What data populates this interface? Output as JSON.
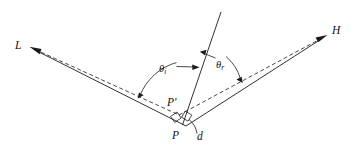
{
  "figure": {
    "background_color": "#ffffff",
    "line_color": "#1a1a1a",
    "labels": {
      "light_vector": "L",
      "halfway_vector": "H",
      "point": "P",
      "point_prime": "P'",
      "distance": "d",
      "theta_incident_base": "θ",
      "theta_incident_sub": "i",
      "theta_reflected_base": "θ",
      "theta_reflected_sub": "r"
    },
    "elements": [
      {
        "name": "L-vector-arrow",
        "kind": "arrow",
        "from": [
          186,
          126
        ],
        "to": [
          30,
          47
        ]
      },
      {
        "name": "H-vector-arrow",
        "kind": "arrow",
        "from": [
          186,
          126
        ],
        "to": [
          327,
          35
        ]
      },
      {
        "name": "normal-ray",
        "kind": "line",
        "from": [
          183,
          124
        ],
        "to": [
          221,
          12
        ]
      },
      {
        "name": "L-dashed-parallel",
        "kind": "dashed",
        "from": [
          176,
          113
        ],
        "to": [
          32,
          49
        ]
      },
      {
        "name": "H-dashed-parallel",
        "kind": "dashed",
        "from": [
          178,
          115
        ],
        "to": [
          324,
          36
        ]
      },
      {
        "name": "theta-i-arc",
        "kind": "arc-with-arrows"
      },
      {
        "name": "theta-r-arc",
        "kind": "arc-with-arrows"
      },
      {
        "name": "d-arc",
        "kind": "arc"
      },
      {
        "name": "right-angle-marker-left",
        "kind": "square"
      },
      {
        "name": "right-angle-marker-right",
        "kind": "square"
      }
    ]
  }
}
